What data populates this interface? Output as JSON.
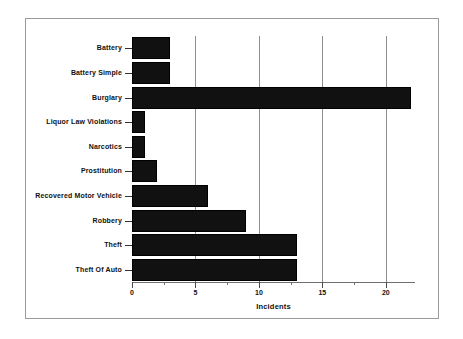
{
  "chart_data": {
    "type": "bar",
    "orientation": "horizontal",
    "title": "",
    "xlabel": "Incidents",
    "ylabel": "",
    "categories": [
      "Battery",
      "Battery Simple",
      "Burglary",
      "Liquor Law Violations",
      "Narcotics",
      "Prostitution",
      "Recovered Motor Vehicle",
      "Robbery",
      "Theft",
      "Theft Of Auto"
    ],
    "values": [
      3,
      3,
      22,
      1,
      1,
      2,
      6,
      9,
      13,
      13
    ],
    "xlim": [
      0,
      22.3
    ],
    "xticks": [
      0,
      5,
      10,
      15,
      20
    ],
    "xtick_labels": [
      "0",
      "5",
      "10",
      "15",
      "20"
    ],
    "xticks_minor": [
      2.5,
      7.5,
      12.5,
      17.5
    ],
    "grid": {
      "vertical": true,
      "horizontal": false,
      "gridline_values": [
        5,
        10,
        15,
        20
      ]
    },
    "legend": {
      "visible": false,
      "position": "none"
    },
    "bar_color": "#111111",
    "grid_color": "#8e8e8e",
    "frame_color": "#9a9a9a",
    "background": "#ffffff"
  }
}
